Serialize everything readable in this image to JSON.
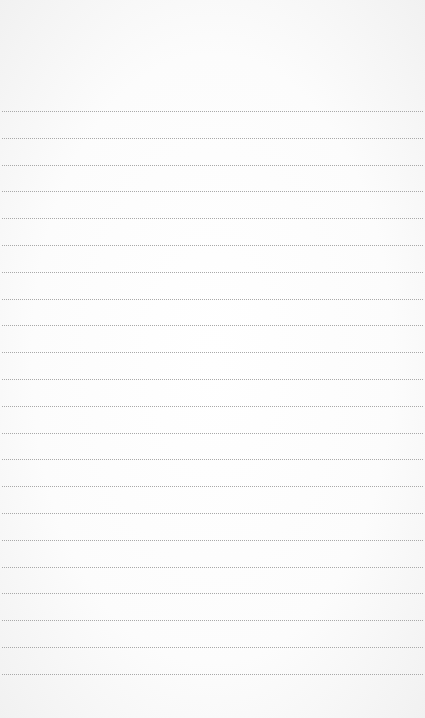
{
  "notepad": {
    "title": "",
    "line_count": 22,
    "first_line_y": 111,
    "line_spacing": 26.8,
    "line_color": "#a9a9a9",
    "paper_color": "#ffffff",
    "lines": [
      "",
      "",
      "",
      "",
      "",
      "",
      "",
      "",
      "",
      "",
      "",
      "",
      "",
      "",
      "",
      "",
      "",
      "",
      "",
      "",
      "",
      ""
    ]
  }
}
